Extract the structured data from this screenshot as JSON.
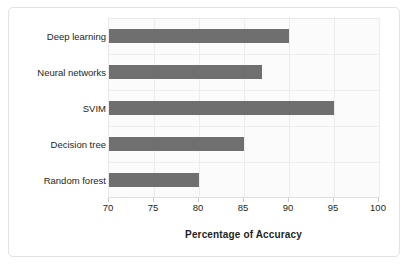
{
  "chart_data": {
    "type": "bar",
    "orientation": "horizontal",
    "title": "",
    "xlabel": "Percentage of Accuracy",
    "ylabel": "Alalgorithms",
    "categories": [
      "Deep learning",
      "Neural networks",
      "SVIM",
      "Decision tree",
      "Random forest"
    ],
    "values": [
      90,
      87,
      95,
      85,
      80
    ],
    "xlim": [
      70,
      100
    ],
    "xticks": [
      70,
      75,
      80,
      85,
      90,
      95,
      100
    ],
    "xtick_labels": [
      "70",
      "75",
      "80",
      "85",
      "90",
      "95",
      "100"
    ],
    "grid": true,
    "legend": "none",
    "bar_color": "#706f70",
    "plot_background": "#fbfbfc",
    "gridline_color": "#ececee",
    "frame_color": "#e2e2e4"
  }
}
